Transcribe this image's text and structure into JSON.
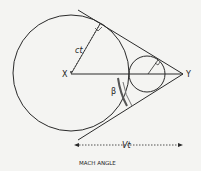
{
  "diagram": {
    "labels": {
      "x_point": "X",
      "y_point": "Y",
      "radius": "ct",
      "angle": "β",
      "distance": "Vt",
      "caption": "MACH ANGLE"
    },
    "colors": {
      "stroke": "#2a2a2a",
      "background": "#f4f4f2"
    }
  }
}
